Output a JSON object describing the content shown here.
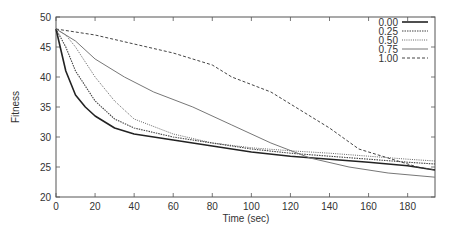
{
  "chart_data": {
    "type": "line",
    "title": "",
    "xlabel": "Time (sec)",
    "ylabel": "Fitness",
    "xlim": [
      0,
      194
    ],
    "ylim": [
      20,
      50
    ],
    "xticks": [
      0,
      20,
      40,
      60,
      80,
      100,
      120,
      140,
      160,
      180
    ],
    "yticks": [
      20,
      25,
      30,
      35,
      40,
      45,
      50
    ],
    "grid": false,
    "legend_position": "top-right",
    "series": [
      {
        "name": "0.00",
        "style": "solid-thick",
        "x": [
          0,
          5,
          10,
          15,
          20,
          30,
          40,
          60,
          80,
          100,
          120,
          140,
          160,
          180,
          194
        ],
        "y": [
          48,
          41,
          37,
          35,
          33.5,
          31.5,
          30.5,
          29.5,
          28.5,
          27.5,
          26.8,
          26.3,
          25.8,
          25.2,
          24.5
        ]
      },
      {
        "name": "0.25",
        "style": "dotted",
        "x": [
          0,
          5,
          10,
          15,
          20,
          30,
          40,
          60,
          80,
          100,
          120,
          140,
          160,
          180,
          194
        ],
        "y": [
          48,
          45,
          41,
          38.5,
          36,
          33,
          31.5,
          30,
          29,
          28,
          27.3,
          26.8,
          26.3,
          25.8,
          25.5
        ]
      },
      {
        "name": "0.50",
        "style": "fine-dotted",
        "x": [
          0,
          5,
          10,
          20,
          30,
          40,
          60,
          80,
          100,
          120,
          140,
          160,
          180,
          194
        ],
        "y": [
          48,
          47,
          45,
          40,
          36,
          33,
          30.5,
          29,
          28.2,
          27.7,
          27.3,
          26.8,
          26.3,
          26
        ]
      },
      {
        "name": "0.75",
        "style": "solid-thin",
        "x": [
          0,
          10,
          20,
          35,
          50,
          70,
          90,
          110,
          130,
          150,
          170,
          194
        ],
        "y": [
          48,
          46,
          43,
          40,
          37.5,
          35,
          32,
          29,
          26.5,
          25,
          24,
          23.3
        ]
      },
      {
        "name": "1.00",
        "style": "dashed",
        "x": [
          0,
          10,
          20,
          40,
          60,
          80,
          90,
          110,
          125,
          140,
          155,
          170,
          185,
          194
        ],
        "y": [
          48,
          47.5,
          47,
          45.5,
          44,
          42,
          40,
          37.5,
          34.5,
          31.5,
          28,
          26.5,
          25,
          24.5
        ]
      }
    ]
  },
  "legend": {
    "items": [
      {
        "label": "0.00"
      },
      {
        "label": "0.25"
      },
      {
        "label": "0.50"
      },
      {
        "label": "0.75"
      },
      {
        "label": "1.00"
      }
    ]
  },
  "colors": {
    "axis": "#555555",
    "series_0": "#222222",
    "series_1": "#444444",
    "series_2": "#555555",
    "series_3": "#777777",
    "series_4": "#444444"
  }
}
